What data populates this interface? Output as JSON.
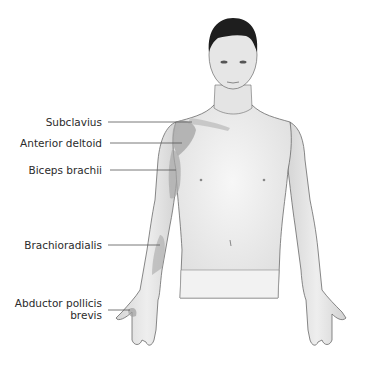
{
  "diagram": {
    "labels": [
      {
        "id": "subclavius",
        "text": "Subclavius"
      },
      {
        "id": "anterior-deltoid",
        "text": "Anterior deltoid"
      },
      {
        "id": "biceps-brachii",
        "text": "Biceps brachii"
      },
      {
        "id": "brachioradialis",
        "text": "Brachioradialis"
      },
      {
        "id": "abductor-pollicis-brevis",
        "line1": "Abductor pollicis",
        "line2": "brevis"
      }
    ],
    "colors": {
      "background": "#ffffff",
      "skin": "#ececec",
      "outline": "#6a6a6a",
      "muscle_highlight": "#a8a8a8",
      "hair": "#1e1e1e",
      "leader_line": "#555555",
      "label_text": "#2b2b2b"
    }
  }
}
